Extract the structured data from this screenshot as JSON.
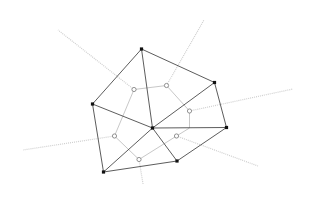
{
  "diagram": {
    "type": "delaunay-voronoi",
    "colors": {
      "background": "#ffffff",
      "delaunay_edge": "#4a4a4a",
      "voronoi_edge": "#c8c8c8",
      "site": "#111111",
      "voronoi_vertex_stroke": "#777777"
    },
    "sites": [
      {
        "id": "A",
        "x": 141.5,
        "y": 49
      },
      {
        "id": "B",
        "x": 214.5,
        "y": 82.5
      },
      {
        "id": "C",
        "x": 92.5,
        "y": 104
      },
      {
        "id": "D",
        "x": 152.5,
        "y": 128
      },
      {
        "id": "E",
        "x": 226.5,
        "y": 127.5
      },
      {
        "id": "F",
        "x": 177,
        "y": 161
      },
      {
        "id": "G",
        "x": 103.5,
        "y": 172
      }
    ],
    "delaunay_edges": [
      [
        "A",
        "B"
      ],
      [
        "A",
        "C"
      ],
      [
        "A",
        "D"
      ],
      [
        "B",
        "D"
      ],
      [
        "B",
        "E"
      ],
      [
        "C",
        "D"
      ],
      [
        "C",
        "G"
      ],
      [
        "D",
        "E"
      ],
      [
        "D",
        "F"
      ],
      [
        "D",
        "G"
      ],
      [
        "E",
        "F"
      ],
      [
        "F",
        "G"
      ]
    ],
    "voronoi_vertices": [
      {
        "id": "v1",
        "x": 134,
        "y": 89.5
      },
      {
        "id": "v2",
        "x": 166.5,
        "y": 85.5
      },
      {
        "id": "v3",
        "x": 189.5,
        "y": 111
      },
      {
        "id": "v4",
        "x": 176.5,
        "y": 136
      },
      {
        "id": "v5",
        "x": 139,
        "y": 159.5
      },
      {
        "id": "v6",
        "x": 114.5,
        "y": 136
      }
    ],
    "voronoi_edges": [
      {
        "points": [
          [
            134,
            89.5
          ],
          [
            166.5,
            85.5
          ]
        ]
      },
      {
        "points": [
          [
            166.5,
            85.5
          ],
          [
            189.5,
            111
          ]
        ]
      },
      {
        "points": [
          [
            189.5,
            111
          ],
          [
            189.5,
            128
          ],
          [
            176.5,
            136
          ]
        ]
      },
      {
        "points": [
          [
            176.5,
            136
          ],
          [
            139,
            159.5
          ]
        ]
      },
      {
        "points": [
          [
            139,
            159.5
          ],
          [
            114.5,
            136
          ]
        ]
      },
      {
        "points": [
          [
            114.5,
            136
          ],
          [
            134,
            89.5
          ]
        ]
      }
    ],
    "voronoi_rays": [
      {
        "from": [
          134,
          89.5
        ],
        "to": [
          58,
          30
        ]
      },
      {
        "from": [
          166.5,
          85.5
        ],
        "to": [
          204,
          20
        ]
      },
      {
        "from": [
          189.5,
          111
        ],
        "to": [
          293,
          89
        ]
      },
      {
        "from": [
          176.5,
          136
        ],
        "to": [
          258,
          166
        ]
      },
      {
        "from": [
          139,
          159.5
        ],
        "to": [
          143,
          184
        ]
      },
      {
        "from": [
          114.5,
          136
        ],
        "to": [
          23,
          150
        ]
      }
    ]
  }
}
